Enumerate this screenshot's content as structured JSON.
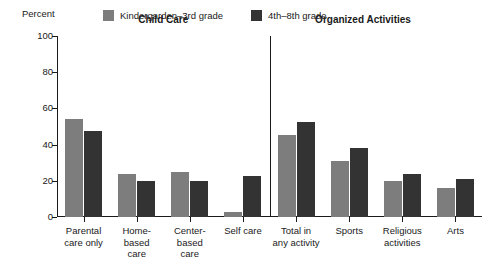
{
  "axis_title": "Percent",
  "colors": {
    "series1": "#7d7d7d",
    "series2": "#333333",
    "axis": "#1a1a1a",
    "background": "#ffffff"
  },
  "legend": {
    "items": [
      {
        "label": "Kindergarden–3rd grade",
        "color": "#7d7d7d",
        "swatch_name": "legend-swatch-kindergarden-3rd-grade"
      },
      {
        "label": "4th–8th grade",
        "color": "#333333",
        "swatch_name": "legend-swatch-4th-8th-grade"
      }
    ]
  },
  "sections": [
    {
      "label": "Child Care",
      "center_pct": 25
    },
    {
      "label": "Organized Activities",
      "center_pct": 72
    }
  ],
  "chart_data": {
    "type": "bar",
    "title": "",
    "subtitle": "",
    "xlabel": "",
    "ylabel": "Percent",
    "ylim": [
      0,
      100
    ],
    "yticks": [
      0,
      20,
      40,
      60,
      80,
      100
    ],
    "ytick_labels": [
      "0",
      "20",
      "40",
      "60",
      "80",
      "100"
    ],
    "grid": false,
    "legend_position": "top",
    "categories": [
      "Parental\ncare only",
      "Home-\nbased\ncare",
      "Center-\nbased\ncare",
      "Self care",
      "Total in\nany activity",
      "Sports",
      "Religious\nactivities",
      "Arts"
    ],
    "series": [
      {
        "name": "Kindergarden–3rd grade",
        "color": "#7d7d7d",
        "values": [
          54,
          24,
          25,
          3,
          45.5,
          31,
          20,
          16
        ]
      },
      {
        "name": "4th–8th grade",
        "color": "#333333",
        "values": [
          47.5,
          20,
          20,
          22.5,
          52.5,
          38,
          24,
          21
        ]
      }
    ],
    "annotations": [
      {
        "text": "Child Care",
        "kind": "section-header"
      },
      {
        "text": "Organized Activities",
        "kind": "section-header"
      },
      {
        "text": "vertical divider between Child Care and Organized Activities",
        "kind": "divider"
      }
    ]
  }
}
